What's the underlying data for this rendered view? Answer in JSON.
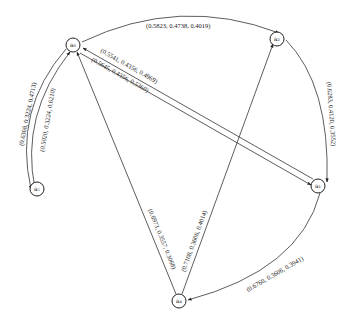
{
  "diagram": {
    "type": "directed-graph",
    "nodes": [
      {
        "id": "a0",
        "label": "a₀"
      },
      {
        "id": "a1",
        "label": "a₁"
      },
      {
        "id": "a2",
        "label": "a₂"
      },
      {
        "id": "a4",
        "label": "a₄"
      },
      {
        "id": "a5",
        "label": "a₅"
      }
    ],
    "edges": [
      {
        "id": "a0-a2",
        "from": "a0",
        "to": "a2",
        "label": "(0.5823, 0.4738, 0.4019)"
      },
      {
        "id": "a1-a0",
        "from": "a1",
        "to": "a0",
        "label": "(0.5541, 0.4356, 0.4969)"
      },
      {
        "id": "a0-a1",
        "from": "a0",
        "to": "a1",
        "label": "(0.5645, 0.4356, 0.5360)"
      },
      {
        "id": "a0-a5",
        "from": "a0",
        "to": "a5",
        "label": "(0.6368, 0.3224, 0.4713)"
      },
      {
        "id": "a5-a0",
        "from": "a5",
        "to": "a0",
        "label": "(0.5020, 0.3224, 0.6210)"
      },
      {
        "id": "a2-a1",
        "from": "a2",
        "to": "a1",
        "label": "(0.6283, 0.4120, 0.3552)"
      },
      {
        "id": "a4-a0",
        "from": "a4",
        "to": "a0",
        "label": "(0.6973, 0.3557, 0.3068)"
      },
      {
        "id": "a4-a2",
        "from": "a4",
        "to": "a2",
        "label": "(0.7108, 0.3606, 0.4014)"
      },
      {
        "id": "a1-a4",
        "from": "a1",
        "to": "a4",
        "label": "(0.6760, 0.3606, 0.3941)"
      }
    ]
  }
}
